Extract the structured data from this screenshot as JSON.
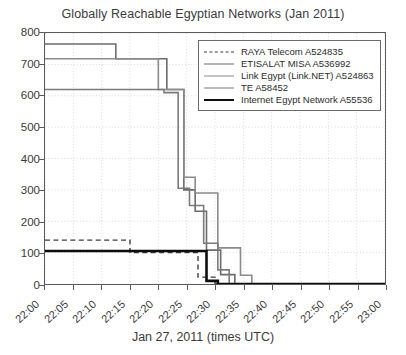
{
  "chart_data": {
    "type": "line",
    "title": "Globally Reachable Egyptian Networks (Jan 2011)",
    "xlabel": "Jan 27, 2011 (times UTC)",
    "ylabel": "",
    "xlim": [
      0,
      60
    ],
    "ylim": [
      0,
      800
    ],
    "grid": true,
    "grid_style": "dotted",
    "legend_position": "upper right",
    "x_tick_labels": [
      "22:00",
      "22:05",
      "22:10",
      "22:15",
      "22:20",
      "22:25",
      "22:30",
      "22:35",
      "22:40",
      "22:45",
      "22:50",
      "22:55",
      "23:00"
    ],
    "x_tick_values": [
      0,
      5,
      10,
      15,
      20,
      25,
      30,
      35,
      40,
      45,
      50,
      55,
      60
    ],
    "y_tick_labels": [
      "0",
      "100",
      "200",
      "300",
      "400",
      "500",
      "600",
      "700",
      "800"
    ],
    "y_tick_values": [
      0,
      100,
      200,
      300,
      400,
      500,
      600,
      700,
      800
    ],
    "step_plot": true,
    "series": [
      {
        "name": "RAYA Telecom A524835",
        "color": "#3d3d3d",
        "style": "dashed",
        "width": 1.4,
        "x": [
          0,
          15,
          15,
          22,
          22,
          27,
          27,
          30,
          30,
          60
        ],
        "y": [
          140,
          140,
          100,
          100,
          100,
          100,
          22,
          22,
          0,
          0
        ]
      },
      {
        "name": "ETISALAT MISA A536992",
        "color": "#6b6b6b",
        "style": "solid",
        "width": 1.6,
        "x": [
          0,
          12.5,
          12.5,
          21.5,
          21.5,
          24.5,
          24.5,
          26.5,
          26.5,
          28.5,
          28.5,
          31,
          31,
          33.5,
          33.5,
          60
        ],
        "y": [
          765,
          765,
          718,
          718,
          620,
          620,
          300,
          300,
          232,
          232,
          108,
          108,
          30,
          30,
          0,
          0
        ]
      },
      {
        "name": "Link Egypt (Link.NET) A524863",
        "color": "#8a8a8a",
        "style": "solid",
        "width": 1.6,
        "x": [
          0,
          20,
          20,
          24.5,
          24.5,
          26.5,
          26.5,
          30.5,
          30.5,
          34.5,
          34.5,
          36.5,
          36.5,
          60
        ],
        "y": [
          718,
          718,
          620,
          620,
          340,
          340,
          290,
          290,
          115,
          115,
          28,
          28,
          0,
          0
        ]
      },
      {
        "name": "TE A58452",
        "color": "#7a7a7a",
        "style": "solid",
        "width": 1.6,
        "x": [
          0,
          21,
          21,
          23.5,
          23.5,
          25.5,
          25.5,
          28,
          28,
          30.5,
          30.5,
          32.5,
          32.5,
          60
        ],
        "y": [
          620,
          620,
          610,
          610,
          305,
          305,
          250,
          250,
          130,
          130,
          45,
          45,
          0,
          0
        ]
      },
      {
        "name": "Internet Egypt Network A55536",
        "color": "#0d0d0d",
        "style": "solid",
        "width": 2.6,
        "x": [
          0,
          28.5,
          28.5,
          30.5,
          30.5,
          60
        ],
        "y": [
          105,
          105,
          10,
          10,
          0,
          0
        ]
      }
    ]
  },
  "legend": {
    "entries": [
      {
        "label": "RAYA Telecom A524835"
      },
      {
        "label": "ETISALAT MISA A536992"
      },
      {
        "label": "Link Egypt (Link.NET) A524863"
      },
      {
        "label": "TE A58452"
      },
      {
        "label": "Internet Egypt Network A55536"
      }
    ]
  }
}
